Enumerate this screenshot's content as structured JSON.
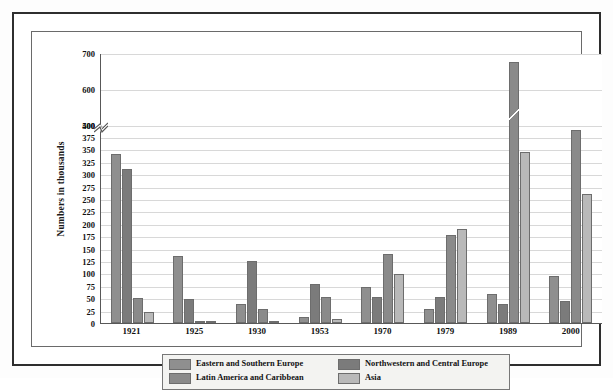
{
  "chart_data": {
    "type": "bar",
    "title": "",
    "xlabel": "",
    "ylabel": "Numbers in thousands",
    "grid": true,
    "legend_position": "bottom",
    "categories": [
      "1921",
      "1925",
      "1930",
      "1953",
      "1970",
      "1979",
      "1989",
      "2000"
    ],
    "ytick_labels": [
      "0",
      "25",
      "50",
      "75",
      "100",
      "125",
      "150",
      "175",
      "200",
      "225",
      "250",
      "275",
      "300",
      "325",
      "350",
      "375",
      "400",
      "500",
      "600",
      "700"
    ],
    "ytick_values": [
      0,
      25,
      50,
      75,
      100,
      125,
      150,
      175,
      200,
      225,
      250,
      275,
      300,
      325,
      350,
      375,
      400,
      500,
      600,
      700
    ],
    "ylim": [
      0,
      700
    ],
    "axis_break": {
      "from": 400,
      "to": 500,
      "label": "broken-axis"
    },
    "series": [
      {
        "name": "Eastern and Southern Europe",
        "color": "#8f8f8f",
        "values": [
          340,
          135,
          38,
          12,
          72,
          28,
          58,
          95
        ]
      },
      {
        "name": "Northwestern and Central Europe",
        "color": "#7b7b7b",
        "values": [
          310,
          48,
          125,
          78,
          52,
          52,
          38,
          45
        ]
      },
      {
        "name": "Latin America and Caribbean",
        "color": "#8a8a8a",
        "values": [
          50,
          2,
          28,
          52,
          140,
          178,
          675,
          390
        ]
      },
      {
        "name": "Asia",
        "color": "#b9b9b9",
        "values": [
          22,
          3,
          4,
          8,
          98,
          190,
          345,
          260
        ]
      }
    ]
  },
  "legend": {
    "items": [
      {
        "label": "Eastern and Southern Europe",
        "color": "#8f8f8f"
      },
      {
        "label": "Northwestern and Central Europe",
        "color": "#7b7b7b"
      },
      {
        "label": "Latin America and Caribbean",
        "color": "#8a8a8a"
      },
      {
        "label": "Asia",
        "color": "#b9b9b9"
      }
    ]
  }
}
